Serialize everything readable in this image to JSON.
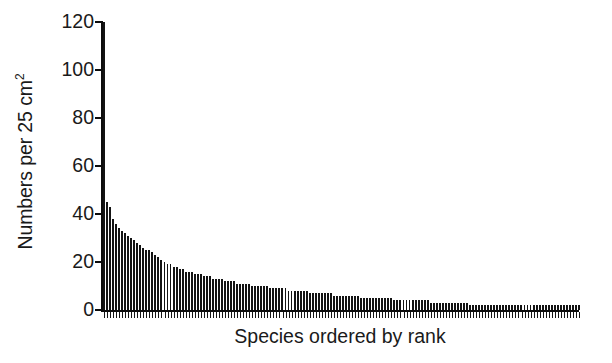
{
  "chart_data": {
    "type": "bar",
    "title": "",
    "subtitle": "",
    "xlabel": "Species ordered by rank",
    "ylabel": "Numbers per 25 cm",
    "ylabel_superscript": "2",
    "ylabel_full": "Numbers per 25 cm2",
    "legend": [],
    "legend_position": "none",
    "grid": false,
    "xlim": [
      0,
      158
    ],
    "ylim": [
      0,
      120
    ],
    "ytick_labels": [
      "0",
      "20",
      "40",
      "60",
      "80",
      "100",
      "120"
    ],
    "ytick_values": [
      0,
      20,
      40,
      60,
      80,
      100,
      120
    ],
    "xtick_labels": [],
    "bar_color": "#141414",
    "axis_color": "#0c0c0c",
    "background_color": "#ffffff",
    "n_bars": 158,
    "categories": [
      "1",
      "2",
      "3",
      "4",
      "5",
      "6",
      "7",
      "8",
      "9",
      "10",
      "11",
      "12",
      "13",
      "14",
      "15",
      "16",
      "17",
      "18",
      "19",
      "20",
      "21",
      "22",
      "23",
      "24",
      "25",
      "26",
      "27",
      "28",
      "29",
      "30",
      "31",
      "32",
      "33",
      "34",
      "35",
      "36",
      "37",
      "38",
      "39",
      "40",
      "41",
      "42",
      "43",
      "44",
      "45",
      "46",
      "47",
      "48",
      "49",
      "50",
      "51",
      "52",
      "53",
      "54",
      "55",
      "56",
      "57",
      "58",
      "59",
      "60",
      "61",
      "62",
      "63",
      "64",
      "65",
      "66",
      "67",
      "68",
      "69",
      "70",
      "71",
      "72",
      "73",
      "74",
      "75",
      "76",
      "77",
      "78",
      "79",
      "80",
      "81",
      "82",
      "83",
      "84",
      "85",
      "86",
      "87",
      "88",
      "89",
      "90",
      "91",
      "92",
      "93",
      "94",
      "95",
      "96",
      "97",
      "98",
      "99",
      "100",
      "101",
      "102",
      "103",
      "104",
      "105",
      "106",
      "107",
      "108",
      "109",
      "110",
      "111",
      "112",
      "113",
      "114",
      "115",
      "116",
      "117",
      "118",
      "119",
      "120",
      "121",
      "122",
      "123",
      "124",
      "125",
      "126",
      "127",
      "128",
      "129",
      "130",
      "131",
      "132",
      "133",
      "134",
      "135",
      "136",
      "137",
      "138",
      "139",
      "140",
      "141",
      "142",
      "143",
      "144",
      "145",
      "146",
      "147",
      "148",
      "149",
      "150",
      "151",
      "152",
      "153",
      "154",
      "155",
      "156",
      "157",
      "158"
    ],
    "values": [
      120,
      45,
      43,
      38,
      36,
      34,
      33,
      32,
      31,
      30,
      29,
      28,
      27,
      26,
      25,
      25,
      24,
      23,
      22,
      21,
      20,
      19,
      19,
      18,
      18,
      17,
      17,
      16,
      16,
      16,
      15,
      15,
      15,
      14,
      14,
      14,
      13,
      13,
      13,
      13,
      12,
      12,
      12,
      12,
      11,
      11,
      11,
      11,
      11,
      10,
      10,
      10,
      10,
      10,
      10,
      9,
      9,
      9,
      9,
      9,
      9,
      8,
      8,
      8,
      8,
      8,
      8,
      8,
      7,
      7,
      7,
      7,
      7,
      7,
      7,
      7,
      6,
      6,
      6,
      6,
      6,
      6,
      6,
      6,
      6,
      5,
      5,
      5,
      5,
      5,
      5,
      5,
      5,
      5,
      5,
      5,
      4,
      4,
      4,
      4,
      4,
      4,
      4,
      4,
      4,
      4,
      4,
      4,
      3,
      3,
      3,
      3,
      3,
      3,
      3,
      3,
      3,
      3,
      3,
      3,
      3,
      2,
      2,
      2,
      2,
      2,
      2,
      2,
      2,
      2,
      2,
      2,
      2,
      2,
      2,
      2,
      2,
      2,
      2,
      2,
      2,
      2,
      2,
      2,
      2,
      2,
      2,
      2,
      2,
      2,
      2,
      2,
      2,
      2,
      2,
      2,
      2,
      2
    ]
  },
  "axes": {
    "ylabel_text": "Numbers per 25 cm",
    "ylabel_sup": "2",
    "xlabel_text": "Species ordered by rank"
  }
}
